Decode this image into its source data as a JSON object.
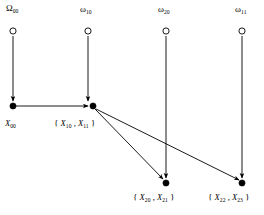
{
  "figure": {
    "type": "directed-graph-diagram",
    "background_color": "#ffffff",
    "stroke_color": "#000000"
  },
  "sources": [
    {
      "id": "omega-00",
      "symbol": "Ω",
      "subscript": "00",
      "cx": 13,
      "cy": 31
    },
    {
      "id": "omega-10",
      "symbol": "ω",
      "subscript": "10",
      "cx": 88,
      "cy": 31
    },
    {
      "id": "omega-20",
      "symbol": "ω",
      "subscript": "20",
      "cx": 166,
      "cy": 31
    },
    {
      "id": "omega-11",
      "symbol": "ω",
      "subscript": "11",
      "cx": 242,
      "cy": 31
    }
  ],
  "nodes": [
    {
      "id": "x-00",
      "cx": 13,
      "cy": 106
    },
    {
      "id": "x-1011",
      "cx": 93,
      "cy": 106
    },
    {
      "id": "x-2021",
      "cx": 166,
      "cy": 183
    },
    {
      "id": "x-2223",
      "cx": 242,
      "cy": 183
    }
  ],
  "labels": {
    "omega_00": {
      "symbol": "Ω",
      "subscript": "00"
    },
    "omega_10": {
      "symbol": "ω",
      "subscript": "10"
    },
    "omega_20": {
      "symbol": "ω",
      "subscript": "20"
    },
    "omega_11": {
      "symbol": "ω",
      "subscript": "11"
    },
    "x_00": {
      "open": "",
      "var1": "X",
      "sub1": "00",
      "sep": "",
      "var2": "",
      "sub2": "",
      "close": ""
    },
    "x_1011": {
      "open": "{ ",
      "var1": "X",
      "sub1": "10",
      "sep": " , ",
      "var2": "X",
      "sub2": "11",
      "close": " }"
    },
    "x_2021": {
      "open": "{ ",
      "var1": "X",
      "sub1": "20",
      "sep": " , ",
      "var2": "X",
      "sub2": "21",
      "close": " }"
    },
    "x_2223": {
      "open": "{ ",
      "var1": "X",
      "sub1": "22",
      "sep": " , ",
      "var2": "X",
      "sub2": "23",
      "close": " }"
    }
  },
  "edges": [
    {
      "id": "edge-omega00-to-x00",
      "from": "omega-00",
      "to": "x-00",
      "kind": "vertical"
    },
    {
      "id": "edge-omega10-to-x1011",
      "from": "omega-10",
      "to": "x-1011",
      "kind": "vertical"
    },
    {
      "id": "edge-omega20-to-x2021",
      "from": "omega-20",
      "to": "x-2021",
      "kind": "vertical"
    },
    {
      "id": "edge-omega11-to-x2223",
      "from": "omega-11",
      "to": "x-2223",
      "kind": "vertical"
    },
    {
      "id": "edge-x00-to-x1011",
      "from": "x-00",
      "to": "x-1011",
      "kind": "horizontal"
    },
    {
      "id": "edge-x1011-to-x2021",
      "from": "x-1011",
      "to": "x-2021",
      "kind": "diagonal"
    },
    {
      "id": "edge-x1011-to-x2223",
      "from": "x-1011",
      "to": "x-2223",
      "kind": "diagonal"
    }
  ]
}
